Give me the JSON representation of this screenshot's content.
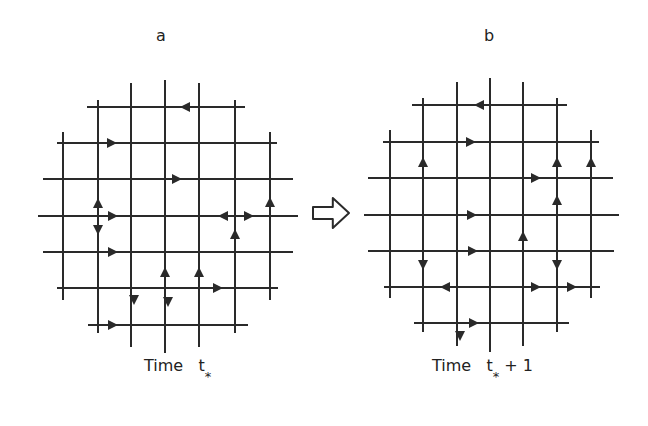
{
  "panels": [
    {
      "id": "a",
      "label": "a",
      "label_pos": [
        156,
        38
      ],
      "caption_time": "Time",
      "caption_t": "t",
      "caption_sub": "*",
      "caption_suffix": "",
      "caption_pos": [
        144,
        368
      ],
      "verticals": [
        [
          63,
          132,
          300
        ],
        [
          98,
          100,
          333
        ],
        [
          131,
          83,
          347
        ],
        [
          165,
          80,
          353
        ],
        [
          199,
          83,
          347
        ],
        [
          235,
          100,
          333
        ],
        [
          270,
          132,
          300
        ]
      ],
      "horizontals": [
        [
          107,
          87,
          245
        ],
        [
          143,
          57,
          277
        ],
        [
          179,
          43,
          293
        ],
        [
          216,
          38,
          298
        ],
        [
          252,
          43,
          293
        ],
        [
          288,
          57,
          278
        ],
        [
          325,
          88,
          248
        ]
      ],
      "arrows": [
        [
          185,
          107,
          "left"
        ],
        [
          112,
          143,
          "right"
        ],
        [
          177,
          179,
          "right"
        ],
        [
          98,
          203,
          "up"
        ],
        [
          113,
          216,
          "right"
        ],
        [
          98,
          230,
          "down"
        ],
        [
          223,
          216,
          "left"
        ],
        [
          249,
          216,
          "right"
        ],
        [
          270,
          202,
          "up"
        ],
        [
          235,
          234,
          "up"
        ],
        [
          113,
          252,
          "right"
        ],
        [
          165,
          272,
          "up"
        ],
        [
          199,
          272,
          "up"
        ],
        [
          218,
          288,
          "right"
        ],
        [
          134,
          300,
          "down"
        ],
        [
          168,
          302,
          "down"
        ],
        [
          113,
          325,
          "right"
        ]
      ]
    },
    {
      "id": "b",
      "label": "b",
      "label_pos": [
        484,
        38
      ],
      "caption_time": "Time",
      "caption_t": "t",
      "caption_sub": "*",
      "caption_suffix": "+ 1",
      "caption_pos": [
        432,
        368
      ],
      "verticals": [
        [
          390,
          130,
          298
        ],
        [
          423,
          98,
          332
        ],
        [
          457,
          82,
          346
        ],
        [
          490,
          78,
          352
        ],
        [
          523,
          82,
          346
        ],
        [
          557,
          98,
          332
        ],
        [
          591,
          130,
          298
        ]
      ],
      "horizontals": [
        [
          105,
          412,
          567
        ],
        [
          142,
          383,
          599
        ],
        [
          178,
          368,
          613
        ],
        [
          215,
          364,
          619
        ],
        [
          251,
          368,
          614
        ],
        [
          287,
          384,
          600
        ],
        [
          323,
          414,
          569
        ]
      ],
      "arrows": [
        [
          479,
          105,
          "left"
        ],
        [
          471,
          142,
          "right"
        ],
        [
          423,
          162,
          "up"
        ],
        [
          557,
          162,
          "up"
        ],
        [
          591,
          162,
          "up"
        ],
        [
          536,
          178,
          "right"
        ],
        [
          557,
          200,
          "up"
        ],
        [
          472,
          215,
          "right"
        ],
        [
          523,
          236,
          "up"
        ],
        [
          473,
          251,
          "right"
        ],
        [
          423,
          265,
          "down"
        ],
        [
          557,
          265,
          "down"
        ],
        [
          445,
          287,
          "left"
        ],
        [
          536,
          287,
          "right"
        ],
        [
          572,
          287,
          "right"
        ],
        [
          474,
          323,
          "right"
        ],
        [
          460,
          336,
          "down"
        ]
      ]
    }
  ],
  "transition_arrow": {
    "icon": "hollow-right-arrow-icon",
    "x": 313,
    "y": 198,
    "w": 36,
    "h": 30
  },
  "colors": {
    "line": "#2a2a2a",
    "background": "#ffffff"
  }
}
